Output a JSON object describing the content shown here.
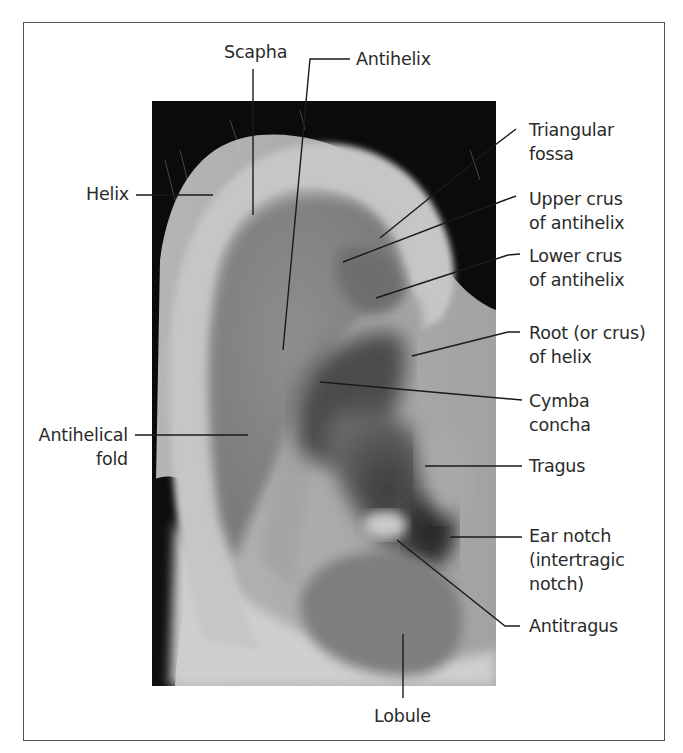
{
  "figure": {
    "labels": {
      "scapha": "Scapha",
      "antihelix": "Antihelix",
      "triangular_fossa": "Triangular\nfossa",
      "helix": "Helix",
      "upper_crus": "Upper crus\nof antihelix",
      "lower_crus": "Lower crus\nof antihelix",
      "root_of_helix": "Root (or crus)\nof helix",
      "cymba_concha": "Cymba\nconcha",
      "antihelical_fold": "Antihelical\nfold",
      "tragus": "Tragus",
      "ear_notch": "Ear notch\n(intertragic\nnotch)",
      "antitragus": "Antitragus",
      "lobule": "Lobule"
    },
    "colors": {
      "frame": "#555555",
      "leader_line": "#1a1a1a",
      "text": "#2a2a2a",
      "hair": "#0a0a0a",
      "skin_light": "#c8c8c8",
      "skin_mid": "#9a9a9a",
      "skin_dark": "#4a4a4a"
    }
  }
}
